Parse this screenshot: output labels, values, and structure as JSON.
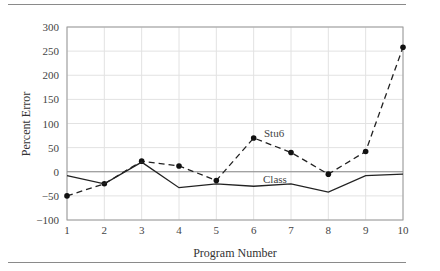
{
  "chart_data": {
    "type": "line",
    "title": "",
    "xlabel": "Program Number",
    "ylabel": "Percent Error",
    "x": [
      1,
      2,
      3,
      4,
      5,
      6,
      7,
      8,
      9,
      10
    ],
    "xlim": [
      1,
      10
    ],
    "ylim": [
      -100,
      300
    ],
    "yticks": [
      -100,
      -50,
      0,
      50,
      100,
      150,
      200,
      250,
      300
    ],
    "xticks": [
      1,
      2,
      3,
      4,
      5,
      6,
      7,
      8,
      9,
      10
    ],
    "grid": true,
    "legend": "inline labels",
    "series": [
      {
        "name": "Stu6",
        "style": "dashed",
        "markers": true,
        "values": [
          -50,
          -25,
          22,
          12,
          -18,
          70,
          40,
          -5,
          42,
          258
        ]
      },
      {
        "name": "Class",
        "style": "solid",
        "markers": false,
        "values": [
          -8,
          -25,
          20,
          -33,
          -25,
          -30,
          -25,
          -42,
          -8,
          -5
        ]
      }
    ],
    "annotations": [
      {
        "text": "Stu6",
        "x": 6,
        "y": 70
      },
      {
        "text": "Class",
        "x": 6.3,
        "y": -10
      }
    ]
  },
  "labels": {
    "xlabel": "Program Number",
    "ylabel": "Percent Error",
    "stu6": "Stu6",
    "class": "Class",
    "yticks": [
      "300",
      "250",
      "200",
      "150",
      "100",
      "50",
      "0",
      "−50",
      "−100"
    ],
    "xticks": [
      "1",
      "2",
      "3",
      "4",
      "5",
      "6",
      "7",
      "8",
      "9",
      "10"
    ]
  }
}
